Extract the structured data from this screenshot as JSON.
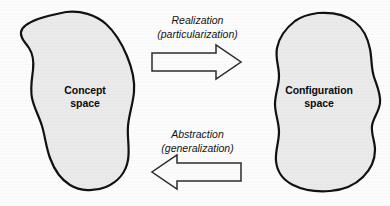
{
  "figure": {
    "type": "diagram",
    "background_color": "#fcfcfc"
  },
  "regions": [
    {
      "id": "concept-space",
      "label_lines": [
        "Concept",
        "space"
      ],
      "fill_color": "#eaeaea",
      "stroke_color": "#111111",
      "side": "left"
    },
    {
      "id": "configuration-space",
      "label_lines": [
        "Configuration",
        "space"
      ],
      "fill_color": "#eaeaea",
      "stroke_color": "#111111",
      "side": "right"
    }
  ],
  "arrows": [
    {
      "id": "realization-arrow",
      "direction": "right",
      "label_lines": [
        "Realization",
        "(particularization)"
      ],
      "fill_color": "#fbfbfb",
      "stroke_color": "#2b2b2b"
    },
    {
      "id": "abstraction-arrow",
      "direction": "left",
      "label_lines": [
        "Abstraction",
        "(generalization)"
      ],
      "fill_color": "#fbfbfb",
      "stroke_color": "#2b2b2b"
    }
  ]
}
